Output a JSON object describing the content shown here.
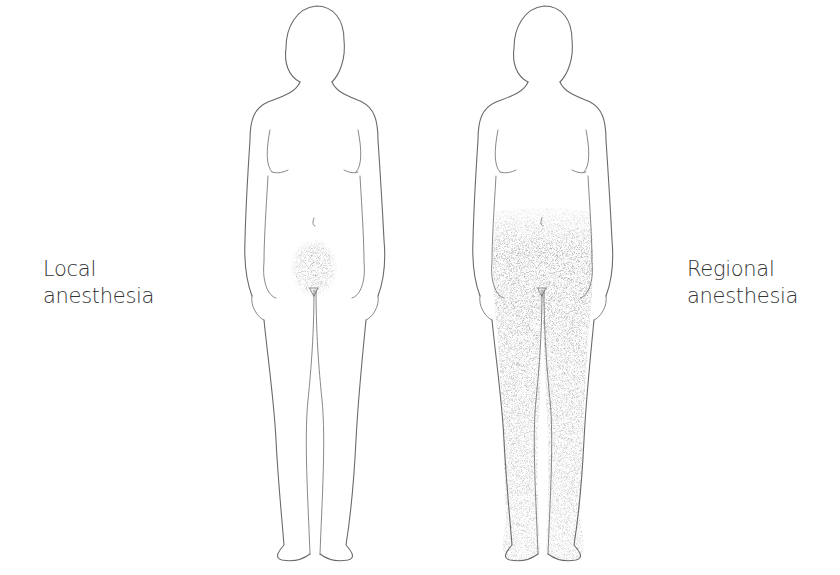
{
  "diagram": {
    "figures": [
      {
        "id": "local",
        "label_lines": [
          "Local",
          "anesthesia"
        ],
        "shaded_region": "groin / perineal area",
        "shade_color": "#7a7a7a"
      },
      {
        "id": "regional",
        "label_lines": [
          "Regional",
          "anesthesia"
        ],
        "shaded_region": "lower abdomen, pelvis and both legs",
        "shade_color": "#7a7a7a"
      }
    ],
    "background_color": "#ffffff",
    "outline_color": "#6a6a6a"
  }
}
